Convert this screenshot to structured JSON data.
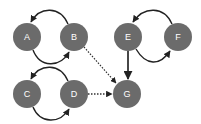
{
  "diagram": {
    "type": "directed-graph",
    "node_color": "#6b6b6b",
    "edge_color": "#222222",
    "label_color": "#ffffff",
    "nodes": [
      {
        "id": "A",
        "label": "A",
        "x": 27,
        "y": 37
      },
      {
        "id": "B",
        "label": "B",
        "x": 74,
        "y": 37
      },
      {
        "id": "E",
        "label": "E",
        "x": 128,
        "y": 37
      },
      {
        "id": "F",
        "label": "F",
        "x": 178,
        "y": 37
      },
      {
        "id": "C",
        "label": "C",
        "x": 27,
        "y": 94
      },
      {
        "id": "D",
        "label": "D",
        "x": 74,
        "y": 94
      },
      {
        "id": "G",
        "label": "G",
        "x": 127,
        "y": 94
      }
    ],
    "edges": [
      {
        "from": "B",
        "to": "A",
        "style": "solid",
        "shape": "arc-top"
      },
      {
        "from": "A",
        "to": "B",
        "style": "solid",
        "shape": "arc-bottom"
      },
      {
        "from": "D",
        "to": "C",
        "style": "solid",
        "shape": "arc-top"
      },
      {
        "from": "C",
        "to": "D",
        "style": "solid",
        "shape": "arc-bottom"
      },
      {
        "from": "F",
        "to": "E",
        "style": "solid",
        "shape": "arc-top"
      },
      {
        "from": "E",
        "to": "F",
        "style": "solid",
        "shape": "arc-bottom"
      },
      {
        "from": "E",
        "to": "G",
        "style": "solid",
        "shape": "straight"
      },
      {
        "from": "B",
        "to": "G",
        "style": "dotted",
        "shape": "straight"
      },
      {
        "from": "D",
        "to": "G",
        "style": "dotted",
        "shape": "straight"
      }
    ]
  }
}
